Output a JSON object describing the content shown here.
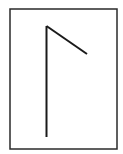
{
  "figure": {
    "glyph_name": "laguz-rune",
    "stroke_color": "#1a1a1a",
    "frame_color": "#2a2a2a",
    "background": "#ffffff"
  }
}
